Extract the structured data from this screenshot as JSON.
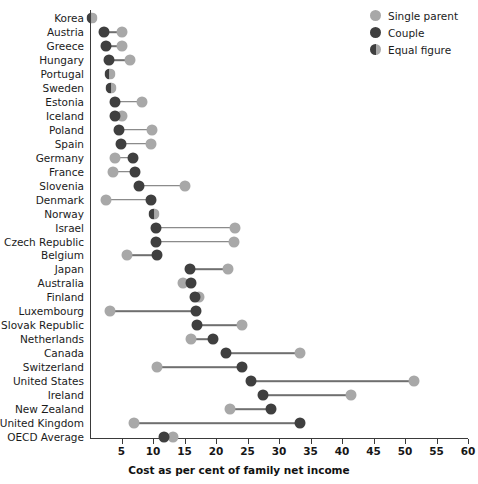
{
  "chart_data": {
    "type": "scatter",
    "subtype": "dumbbell",
    "title": "",
    "xlabel": "Cost as per cent of family net income",
    "ylabel": "",
    "xlim": [
      0,
      60
    ],
    "xticks": [
      5,
      10,
      15,
      20,
      25,
      30,
      35,
      40,
      45,
      50,
      55,
      60
    ],
    "grid": false,
    "legend_position": "top-right",
    "legend": [
      {
        "key": "single_parent",
        "label": "Single parent",
        "color": "#a8a8a8"
      },
      {
        "key": "couple",
        "label": "Couple",
        "color": "#3f3f3f"
      },
      {
        "key": "equal",
        "label": "Equal figure",
        "color": "#6f6f6f"
      }
    ],
    "series": [
      {
        "name": "Single parent",
        "key": "single_parent",
        "color": "#a8a8a8"
      },
      {
        "name": "Couple",
        "key": "couple",
        "color": "#3f3f3f"
      }
    ],
    "categories": [
      "Korea",
      "Austria",
      "Greece",
      "Hungary",
      "Portugal",
      "Sweden",
      "Estonia",
      "Iceland",
      "Poland",
      "Spain",
      "Germany",
      "France",
      "Slovenia",
      "Denmark",
      "Norway",
      "Israel",
      "Czech Republic",
      "Belgium",
      "Japan",
      "Australia",
      "Finland",
      "Luxembourg",
      "Slovak Republic",
      "Netherlands",
      "Canada",
      "Switzerland",
      "United States",
      "Ireland",
      "New Zealand",
      "United Kingdom",
      "OECD Average"
    ],
    "rows": [
      {
        "country": "Korea",
        "couple": 0.3,
        "single_parent": 0.3,
        "equal": true
      },
      {
        "country": "Austria",
        "couple": 2.3,
        "single_parent": 5.1,
        "equal": false
      },
      {
        "country": "Greece",
        "couple": 2.5,
        "single_parent": 5.1,
        "equal": false
      },
      {
        "country": "Hungary",
        "couple": 3.0,
        "single_parent": 6.3,
        "equal": false
      },
      {
        "country": "Portugal",
        "couple": 3.1,
        "single_parent": 3.1,
        "equal": true
      },
      {
        "country": "Sweden",
        "couple": 3.4,
        "single_parent": 3.4,
        "equal": true
      },
      {
        "country": "Estonia",
        "couple": 3.9,
        "single_parent": 8.3,
        "equal": false
      },
      {
        "country": "Iceland",
        "couple": 4.0,
        "single_parent": 5.0,
        "equal": false
      },
      {
        "country": "Poland",
        "couple": 4.6,
        "single_parent": 9.9,
        "equal": false
      },
      {
        "country": "Spain",
        "couple": 4.9,
        "single_parent": 9.7,
        "equal": false
      },
      {
        "country": "Germany",
        "couple": 6.9,
        "single_parent": 4.0,
        "equal": false
      },
      {
        "country": "France",
        "couple": 7.2,
        "single_parent": 3.7,
        "equal": false
      },
      {
        "country": "Slovenia",
        "couple": 7.8,
        "single_parent": 15.1,
        "equal": false
      },
      {
        "country": "Denmark",
        "couple": 9.7,
        "single_parent": 2.6,
        "equal": false
      },
      {
        "country": "Norway",
        "couple": 10.2,
        "single_parent": 10.2,
        "equal": true
      },
      {
        "country": "Israel",
        "couple": 10.4,
        "single_parent": 23.0,
        "equal": false
      },
      {
        "country": "Czech Republic",
        "couple": 10.5,
        "single_parent": 22.9,
        "equal": false
      },
      {
        "country": "Belgium",
        "couple": 10.7,
        "single_parent": 5.9,
        "equal": false
      },
      {
        "country": "Japan",
        "couple": 15.9,
        "single_parent": 21.9,
        "equal": false
      },
      {
        "country": "Australia",
        "couple": 16.0,
        "single_parent": 14.8,
        "equal": false
      },
      {
        "country": "Finland",
        "couple": 16.6,
        "single_parent": 17.3,
        "equal": false
      },
      {
        "country": "Luxembourg",
        "couple": 16.9,
        "single_parent": 3.2,
        "equal": false
      },
      {
        "country": "Slovak Republic",
        "couple": 17.0,
        "single_parent": 24.2,
        "equal": false
      },
      {
        "country": "Netherlands",
        "couple": 19.6,
        "single_parent": 16.0,
        "equal": false
      },
      {
        "country": "Canada",
        "couple": 21.6,
        "single_parent": 33.3,
        "equal": false
      },
      {
        "country": "Switzerland",
        "couple": 24.2,
        "single_parent": 10.6,
        "equal": false
      },
      {
        "country": "United States",
        "couple": 25.6,
        "single_parent": 51.5,
        "equal": false
      },
      {
        "country": "Ireland",
        "couple": 27.4,
        "single_parent": 41.5,
        "equal": false
      },
      {
        "country": "New Zealand",
        "couple": 28.7,
        "single_parent": 22.2,
        "equal": false
      },
      {
        "country": "United Kingdom",
        "couple": 33.3,
        "single_parent": 7.0,
        "equal": false
      },
      {
        "country": "OECD Average",
        "couple": 11.8,
        "single_parent": 13.1,
        "equal": false
      }
    ]
  }
}
